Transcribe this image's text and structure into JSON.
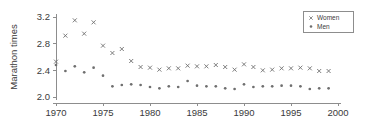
{
  "chart_data": {
    "type": "scatter",
    "title": "",
    "xlabel": "",
    "ylabel": "Marathon times",
    "xlim": [
      1969,
      2000.5
    ],
    "ylim": [
      2.0,
      3.2
    ],
    "xticks": [
      1970,
      1975,
      1980,
      1985,
      1990,
      1995,
      2000
    ],
    "yticks": [
      2.0,
      2.4,
      2.8,
      3.2
    ],
    "ytick_labels": [
      "2.0",
      "2.4",
      "2.8",
      "3.2"
    ],
    "xtick_labels": [
      "1970",
      "1975",
      "1980",
      "1985",
      "1990",
      "1995",
      "2000"
    ],
    "grid": false,
    "legend_position": "top-right",
    "x": [
      1970,
      1971,
      1972,
      1973,
      1974,
      1975,
      1976,
      1977,
      1978,
      1979,
      1980,
      1981,
      1982,
      1983,
      1984,
      1985,
      1986,
      1987,
      1988,
      1989,
      1990,
      1991,
      1992,
      1993,
      1994,
      1995,
      1996,
      1997,
      1998,
      1999
    ],
    "series": [
      {
        "name": "Women",
        "marker": "x",
        "color": "#6f6f6f",
        "values": [
          2.53,
          2.92,
          3.15,
          2.95,
          3.12,
          2.77,
          2.66,
          2.72,
          2.54,
          2.45,
          2.44,
          2.41,
          2.43,
          2.43,
          2.47,
          2.46,
          2.46,
          2.48,
          2.45,
          2.41,
          2.49,
          2.45,
          2.4,
          2.41,
          2.43,
          2.43,
          2.44,
          2.43,
          2.39,
          2.39
        ]
      },
      {
        "name": "Men",
        "marker": "dot",
        "color": "#6f6f6f",
        "values": [
          2.48,
          2.39,
          2.46,
          2.37,
          2.44,
          2.32,
          2.16,
          2.18,
          2.19,
          2.18,
          2.15,
          2.13,
          2.16,
          2.15,
          2.24,
          2.17,
          2.16,
          2.16,
          2.13,
          2.12,
          2.19,
          2.15,
          2.16,
          2.16,
          2.17,
          2.17,
          2.16,
          2.12,
          2.13,
          2.13
        ]
      }
    ]
  },
  "legend": {
    "entries": [
      {
        "label": "Women"
      },
      {
        "label": "Men"
      }
    ]
  },
  "axes": {
    "y_title": "Marathon times"
  }
}
